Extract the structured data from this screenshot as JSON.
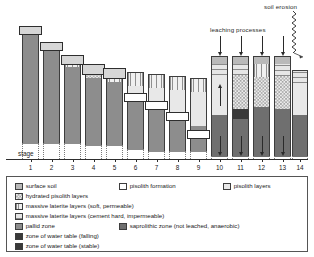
{
  "figure": {
    "annotations": {
      "leaching": "leaching processes",
      "erosion": "soil erosion",
      "stage_axis_label": "stage"
    },
    "stages": [
      "1",
      "2",
      "3",
      "4",
      "5",
      "6",
      "7",
      "8",
      "9",
      "10",
      "11",
      "12",
      "13",
      "14"
    ]
  },
  "legend": {
    "items": [
      {
        "key": "surface-soil",
        "label": "surface soil",
        "fill": "#b9b9b9"
      },
      {
        "key": "pisolith-formation",
        "label": "pisolith formation",
        "fill": "#ffffff"
      },
      {
        "key": "pisolith-layers",
        "label": "pisolith layers",
        "fill": "#e8e8e8"
      },
      {
        "key": "hydrated-pisolith",
        "label": "hydrated pisolith layers",
        "fill": "#ededed"
      },
      {
        "key": "laterite-soft",
        "label": "massive laterite layers (soft, permeable)",
        "fill": "#f0f0f0"
      },
      {
        "key": "laterite-hard",
        "label": "massive laterite layers (cement hard, impermeable)",
        "fill": "#e6e6e6"
      },
      {
        "key": "pallid-zone",
        "label": "pallid zone",
        "fill": "#8d8d8d"
      },
      {
        "key": "saprolithic-zone",
        "label": "saprolithic zone (not leached, anaerobic)",
        "fill": "#6f6f6f"
      },
      {
        "key": "water-table-fall",
        "label": "zone of water table (falling)",
        "fill": "#3a3a3a"
      },
      {
        "key": "water-table-stable",
        "label": "zone of water table (stable)",
        "fill": "#3a3a3a"
      }
    ]
  },
  "chart_data": {
    "type": "diagram",
    "xlabel": "stage",
    "columns": [
      {
        "stage": "1",
        "x": 22,
        "top": 28,
        "width": 17,
        "segments": [
          {
            "type": "pisolith-formation",
            "h": 0
          },
          {
            "type": "pallid-zone",
            "h": 115
          }
        ],
        "cap": {
          "y": 26,
          "h": 9,
          "overhang": 3
        },
        "water_table": null,
        "arrow": null
      },
      {
        "stage": "2",
        "x": 43,
        "top": 44,
        "width": 17,
        "segments": [
          {
            "type": "pallid-zone",
            "h": 99
          }
        ],
        "cap": {
          "y": 42,
          "h": 9,
          "overhang": 3
        },
        "water_table": null,
        "arrow": null
      },
      {
        "stage": "3",
        "x": 64,
        "top": 57,
        "width": 17,
        "segments": [
          {
            "type": "laterite-soft",
            "h": 9
          },
          {
            "type": "pallid-zone",
            "h": 77
          }
        ],
        "cap": {
          "y": 55,
          "h": 10,
          "overhang": 3
        },
        "water_table": null,
        "arrow": null
      },
      {
        "stage": "4",
        "x": 85,
        "top": 66,
        "width": 17,
        "segments": [
          {
            "type": "hydrated-pisolith",
            "h": 11
          },
          {
            "type": "pallid-zone",
            "h": 68
          }
        ],
        "cap": {
          "y": 64,
          "h": 11,
          "overhang": 3
        },
        "water_table": null,
        "arrow": null
      },
      {
        "stage": "5",
        "x": 106,
        "top": 70,
        "width": 17,
        "segments": [
          {
            "type": "laterite-soft",
            "h": 11
          },
          {
            "type": "pallid-zone",
            "h": 64
          }
        ],
        "cap": {
          "y": 68,
          "h": 11,
          "overhang": 3
        },
        "water_table": null,
        "arrow": null
      },
      {
        "stage": "6",
        "x": 127,
        "top": 72,
        "width": 17,
        "segments": [
          {
            "type": "laterite-soft",
            "h": 13
          },
          {
            "type": "pisolith-layers",
            "h": 8
          },
          {
            "type": "pallid-zone",
            "h": 56
          }
        ],
        "cap": null,
        "water_table": {
          "y": 93,
          "h": 9,
          "kind": "falling"
        },
        "arrow": null
      },
      {
        "stage": "7",
        "x": 148,
        "top": 74,
        "width": 17,
        "segments": [
          {
            "type": "laterite-soft",
            "h": 13
          },
          {
            "type": "pisolith-layers",
            "h": 14
          },
          {
            "type": "pallid-zone",
            "h": 50
          }
        ],
        "cap": null,
        "water_table": {
          "y": 101,
          "h": 9,
          "kind": "falling"
        },
        "arrow": null
      },
      {
        "stage": "8",
        "x": 169,
        "top": 76,
        "width": 17,
        "segments": [
          {
            "type": "laterite-soft",
            "h": 13
          },
          {
            "type": "pisolith-layers",
            "h": 22
          },
          {
            "type": "pallid-zone",
            "h": 40
          }
        ],
        "cap": null,
        "water_table": {
          "y": 112,
          "h": 9,
          "kind": "falling"
        },
        "arrow": null
      },
      {
        "stage": "9",
        "x": 190,
        "top": 78,
        "width": 17,
        "segments": [
          {
            "type": "laterite-soft",
            "h": 13
          },
          {
            "type": "pisolith-layers",
            "h": 34
          },
          {
            "type": "pallid-zone",
            "h": 26
          }
        ],
        "cap": null,
        "water_table": {
          "y": 130,
          "h": 9,
          "kind": "falling"
        },
        "arrow": null
      },
      {
        "stage": "10",
        "x": 211,
        "top": 56,
        "width": 17,
        "segments": [
          {
            "type": "surface-soil",
            "h": 7
          },
          {
            "type": "laterite-hard",
            "h": 11
          },
          {
            "type": "pisolith-layers",
            "h": 40
          },
          {
            "type": "saprolithic-zone",
            "h": 42
          }
        ],
        "cap": null,
        "water_table": null,
        "arrow": {
          "dir": "down",
          "top": 36,
          "h": 16
        },
        "inner_arrow": {
          "dir": "up",
          "y": 88,
          "h": 18
        }
      },
      {
        "stage": "11",
        "x": 232,
        "top": 56,
        "width": 17,
        "segments": [
          {
            "type": "surface-soil",
            "h": 7
          },
          {
            "type": "laterite-hard",
            "h": 11
          },
          {
            "type": "hydrated-pisolith",
            "h": 34
          },
          {
            "type": "water-table-stable",
            "h": 10
          },
          {
            "type": "saprolithic-zone",
            "h": 38
          }
        ],
        "cap": null,
        "water_table": null,
        "arrow": {
          "dir": "down",
          "top": 36,
          "h": 16
        }
      },
      {
        "stage": "12",
        "x": 253,
        "top": 56,
        "width": 17,
        "segments": [
          {
            "type": "surface-soil",
            "h": 7
          },
          {
            "type": "laterite-soft",
            "h": 13
          },
          {
            "type": "hydrated-pisolith",
            "h": 30
          },
          {
            "type": "saprolithic-zone",
            "h": 50
          }
        ],
        "cap": null,
        "water_table": null,
        "arrow": {
          "dir": "down",
          "top": 36,
          "h": 16
        }
      },
      {
        "stage": "13",
        "x": 274,
        "top": 56,
        "width": 17,
        "segments": [
          {
            "type": "surface-soil",
            "h": 7
          },
          {
            "type": "laterite-hard",
            "h": 12
          },
          {
            "type": "hydrated-pisolith",
            "h": 33
          },
          {
            "type": "saprolithic-zone",
            "h": 48
          }
        ],
        "cap": null,
        "water_table": null,
        "arrow": {
          "dir": "down",
          "top": 36,
          "h": 16
        }
      },
      {
        "stage": "14",
        "x": 292,
        "top": 70,
        "width": 16,
        "segments": [
          {
            "type": "laterite-hard",
            "h": 12
          },
          {
            "type": "pisolith-layers",
            "h": 32
          },
          {
            "type": "saprolithic-zone",
            "h": 42
          }
        ],
        "cap": null,
        "water_table": null,
        "arrow": null,
        "erosion": true
      }
    ]
  }
}
